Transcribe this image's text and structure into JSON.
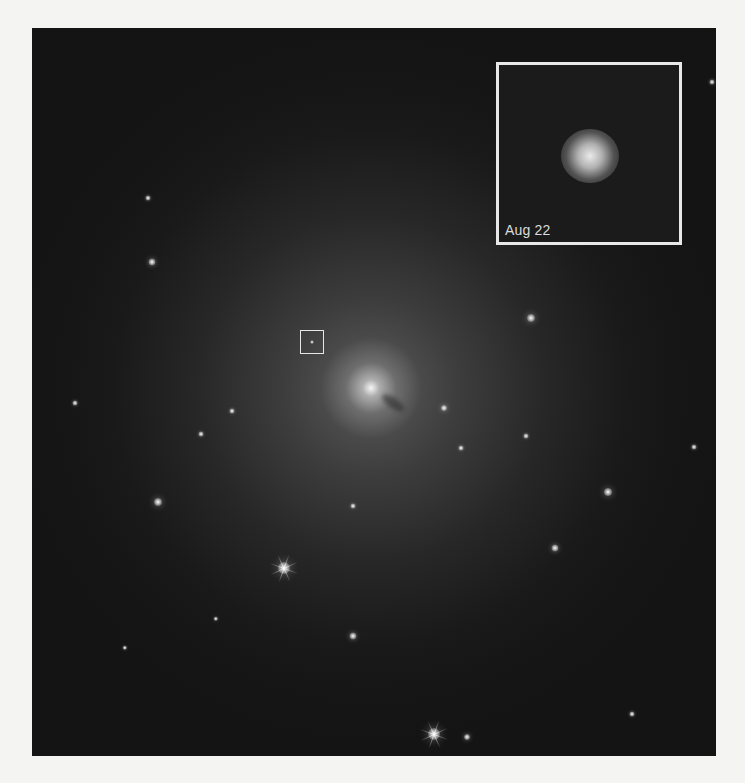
{
  "figure": {
    "background_color": "#f4f4f2",
    "photo": {
      "description": "Galaxy field with elliptical galaxy halo and marked transient",
      "background_color": "#141414"
    },
    "marker_box": {
      "position_px": [
        315,
        342
      ]
    },
    "inset": {
      "label": "Aug 22",
      "border_color": "#e8e8e8"
    },
    "stars": [
      {
        "x": 284,
        "y": 568,
        "r": 5,
        "spikes": true
      },
      {
        "x": 434,
        "y": 734,
        "r": 5,
        "spikes": true
      },
      {
        "x": 158,
        "y": 502,
        "r": 3
      },
      {
        "x": 152,
        "y": 262,
        "r": 2.5
      },
      {
        "x": 531,
        "y": 318,
        "r": 3
      },
      {
        "x": 608,
        "y": 492,
        "r": 3
      },
      {
        "x": 555,
        "y": 548,
        "r": 2.5
      },
      {
        "x": 353,
        "y": 636,
        "r": 2.5
      },
      {
        "x": 444,
        "y": 408,
        "r": 2
      },
      {
        "x": 461,
        "y": 448,
        "r": 1.5
      },
      {
        "x": 201,
        "y": 434,
        "r": 1.5
      },
      {
        "x": 232,
        "y": 411,
        "r": 1.5
      },
      {
        "x": 353,
        "y": 506,
        "r": 1.5
      },
      {
        "x": 526,
        "y": 436,
        "r": 1.5
      },
      {
        "x": 75,
        "y": 403,
        "r": 1.5
      },
      {
        "x": 148,
        "y": 198,
        "r": 1.5
      },
      {
        "x": 694,
        "y": 447,
        "r": 1.5
      },
      {
        "x": 632,
        "y": 714,
        "r": 1.5
      },
      {
        "x": 467,
        "y": 737,
        "r": 2
      },
      {
        "x": 216,
        "y": 619,
        "r": 1.2
      },
      {
        "x": 125,
        "y": 648,
        "r": 1.2
      },
      {
        "x": 712,
        "y": 82,
        "r": 1.5
      }
    ]
  }
}
